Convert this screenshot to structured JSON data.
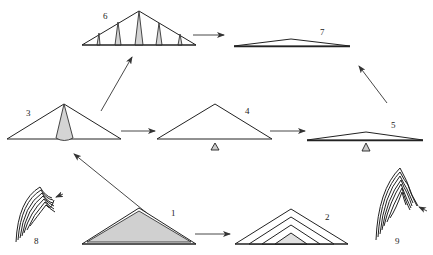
{
  "diagram": {
    "type": "stage-sequence",
    "figures": [
      {
        "id": "1",
        "label": "1",
        "shape": "shaded triangle with double outline"
      },
      {
        "id": "2",
        "label": "2",
        "shape": "nested triangles (layered)"
      },
      {
        "id": "3",
        "label": "3",
        "shape": "triangle with central shaded wedge"
      },
      {
        "id": "4",
        "label": "4",
        "shape": "triangle on small fulcrum"
      },
      {
        "id": "5",
        "label": "5",
        "shape": "flattened triangle on small fulcrum"
      },
      {
        "id": "6",
        "label": "6",
        "shape": "triangle with multiple shaded spikes"
      },
      {
        "id": "7",
        "label": "7",
        "shape": "very flat triangle"
      },
      {
        "id": "8",
        "label": "8",
        "shape": "curved layered lines with arrow marker"
      },
      {
        "id": "9",
        "label": "9",
        "shape": "curved layered lines with steps and arrow marker"
      }
    ],
    "arrows": [
      {
        "from": "1",
        "to": "2"
      },
      {
        "from": "1",
        "to": "3"
      },
      {
        "from": "3",
        "to": "4"
      },
      {
        "from": "3",
        "to": "6"
      },
      {
        "from": "4",
        "to": "5"
      },
      {
        "from": "5",
        "to": "7"
      },
      {
        "from": "6",
        "to": "7"
      }
    ],
    "colors": {
      "line": "#222222",
      "fill_gray": "#d4d4d4",
      "background": "#ffffff"
    }
  }
}
